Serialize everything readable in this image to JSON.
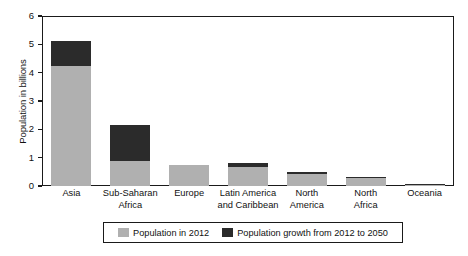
{
  "chart_data": {
    "type": "bar",
    "subtype": "stacked-bar",
    "title": "",
    "xlabel": "",
    "ylabel": "Population in billions",
    "ylim": [
      0,
      6
    ],
    "yticks": [
      "0",
      "1",
      "2",
      "3",
      "4",
      "5",
      "6"
    ],
    "grid": false,
    "legend_position": "bottom",
    "categories": [
      "Asia",
      "Sub-Saharan Africa",
      "Europe",
      "Latin America and Caribbean",
      "North America",
      "North Africa",
      "Oceania"
    ],
    "category_lines": [
      [
        "Asia"
      ],
      [
        "Sub-Saharan",
        "Africa"
      ],
      [
        "Europe"
      ],
      [
        "Latin America",
        "and Caribbean"
      ],
      [
        "North",
        "America"
      ],
      [
        "North",
        "Africa"
      ],
      [
        "Oceania"
      ]
    ],
    "series": [
      {
        "name": "Population in 2012",
        "color": "#b0b0b0",
        "values": [
          4.25,
          0.9,
          0.75,
          0.68,
          0.42,
          0.27,
          0.04
        ]
      },
      {
        "name": "Population growth from 2012 to 2050",
        "color": "#2b2b2b",
        "values": [
          0.87,
          1.25,
          0.0,
          0.14,
          0.09,
          0.06,
          0.04
        ]
      }
    ],
    "totals": [
      5.12,
      2.15,
      0.75,
      0.82,
      0.51,
      0.33,
      0.08
    ]
  },
  "legend": {
    "items": [
      {
        "label": "Population in 2012",
        "color": "#b0b0b0"
      },
      {
        "label": "Population growth from 2012 to 2050",
        "color": "#2b2b2b"
      }
    ]
  }
}
